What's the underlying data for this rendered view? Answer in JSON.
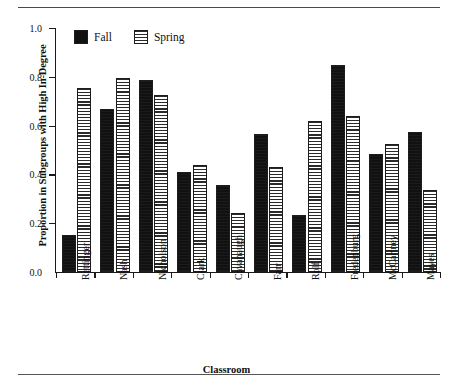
{
  "figure": {
    "top_caption": "",
    "xlabel": "Classroom",
    "ylabel": "Proportion in Subgroups with High In-Degree"
  },
  "legend": {
    "entries": [
      {
        "label": "Fall",
        "swatch": "solid-black-swatch"
      },
      {
        "label": "Spring",
        "swatch": "horizontal-striped-swatch"
      }
    ]
  },
  "chart_data": {
    "type": "bar",
    "title": "",
    "xlabel": "Classroom",
    "ylabel": "Proportion in Subgroups with High In-Degree",
    "ylim": [
      0.0,
      1.0
    ],
    "yticks": [
      0.0,
      0.2,
      0.4,
      0.6,
      0.8,
      1.0
    ],
    "ytick_labels": [
      "0.0",
      "0.2",
      "0.4",
      "0.6",
      "0.8",
      "1.0"
    ],
    "grid": false,
    "legend_position": "top-left-inside",
    "categories": [
      "Rettinger",
      "Nash",
      "Nicholson",
      "Clark",
      "Cavanaugh",
      "Farr",
      "Rolf",
      "Fredenburg",
      "McCartney",
      "Mayes"
    ],
    "series": [
      {
        "name": "Fall",
        "color": "#111111",
        "pattern": "solid",
        "values": [
          0.15,
          0.67,
          0.785,
          0.41,
          0.355,
          0.565,
          0.235,
          0.85,
          0.485,
          0.575
        ]
      },
      {
        "name": "Spring",
        "color": "#ffffff",
        "pattern": "horizontal-stripes",
        "values": [
          0.755,
          0.795,
          0.725,
          0.44,
          0.24,
          0.43,
          0.62,
          0.64,
          0.525,
          0.335
        ]
      }
    ]
  }
}
